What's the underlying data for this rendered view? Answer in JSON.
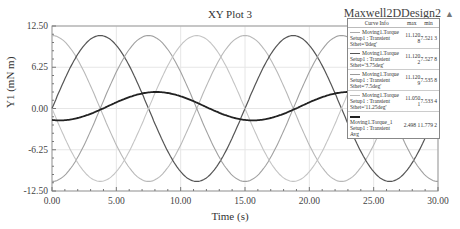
{
  "header": {
    "title": "XY Plot 3",
    "design_name": "Maxwell2DDesign2",
    "design_icon": "triangle-up-icon"
  },
  "axes": {
    "xlabel": "Time (s)",
    "ylabel": "Y1 (mN m)",
    "xticks": [
      "0.00",
      "5.00",
      "10.00",
      "15.00",
      "20.00",
      "25.00",
      "30.00"
    ],
    "yticks": [
      "12.50",
      "6.25",
      "0.00",
      "-6.25",
      "-12.50"
    ]
  },
  "legend": {
    "headers": [
      "Curve Info",
      "max",
      "min"
    ],
    "rows": [
      {
        "name": "Moving1.Torque",
        "setup": "Setup1 : Transient",
        "param": "Sthet='0deg'",
        "max": "11.120 8",
        "min": "7.521 3",
        "color": "#aaaaaa"
      },
      {
        "name": "Moving1.Torque",
        "setup": "Setup1 : Transient",
        "param": "Sthet='3.75deg'",
        "max": "11.120 2",
        "min": "7.527 8",
        "color": "#555555"
      },
      {
        "name": "Moving1.Torque",
        "setup": "Setup1 : Transient",
        "param": "Sthet='7.5deg'",
        "max": "11.120 9",
        "min": "7.535 8",
        "color": "#999999"
      },
      {
        "name": "Moving1.Torque",
        "setup": "Setup1 : Transient",
        "param": "Sthet='11.25deg'",
        "max": "11.050 1",
        "min": "7.533 4",
        "color": "#bbbbbb"
      },
      {
        "name": "Moving1.Torque_1",
        "setup": "Setup1 : Transient",
        "param": "Avg",
        "max": "2.498 1",
        "min": "1.779 2",
        "color": "#222222"
      }
    ]
  },
  "chart_data": {
    "type": "line",
    "title": "XY Plot 3",
    "xlabel": "Time (s)",
    "ylabel": "Y1 (mN m)",
    "xlim": [
      0,
      30
    ],
    "ylim": [
      -12.5,
      12.5
    ],
    "grid": true,
    "legend_position": "top-right",
    "x": [
      0,
      1.875,
      3.75,
      5.625,
      7.5,
      9.375,
      11.25,
      13.125,
      15,
      16.875,
      18.75,
      20.625,
      22.5,
      24.375,
      26.25,
      28.125,
      30
    ],
    "series": [
      {
        "name": "Moving1.Torque Sthet='0deg'",
        "values": [
          11.0,
          7.8,
          0.0,
          -7.8,
          -11.0,
          -7.8,
          0.0,
          7.8,
          11.0,
          7.8,
          0.0,
          -7.8,
          -11.0,
          -7.8,
          0.0,
          7.8,
          11.0
        ]
      },
      {
        "name": "Moving1.Torque Sthet='3.75deg'",
        "values": [
          0.0,
          7.8,
          11.0,
          7.8,
          0.0,
          -7.8,
          -11.0,
          -7.8,
          0.0,
          7.8,
          11.0,
          7.8,
          0.0,
          -7.8,
          -11.0,
          -7.8,
          0.0
        ]
      },
      {
        "name": "Moving1.Torque Sthet='7.5deg'",
        "values": [
          -11.0,
          -7.8,
          0.0,
          7.8,
          11.0,
          7.8,
          0.0,
          -7.8,
          -11.0,
          -7.8,
          0.0,
          7.8,
          11.0,
          7.8,
          0.0,
          -7.8,
          -11.0
        ]
      },
      {
        "name": "Moving1.Torque Sthet='11.25deg'",
        "values": [
          0.0,
          -7.8,
          -11.0,
          -7.8,
          0.0,
          7.8,
          11.0,
          7.8,
          0.0,
          -7.8,
          -11.0,
          -7.8,
          0.0,
          7.8,
          11.0,
          7.8,
          0.0
        ]
      },
      {
        "name": "Moving1.Torque_1 Avg",
        "values": [
          -1.8,
          -0.6,
          1.0,
          2.2,
          2.5,
          1.8,
          0.4,
          -1.0,
          -1.8,
          -0.6,
          1.0,
          2.2,
          2.5,
          1.8,
          0.4,
          -1.0,
          -1.8
        ]
      }
    ]
  }
}
